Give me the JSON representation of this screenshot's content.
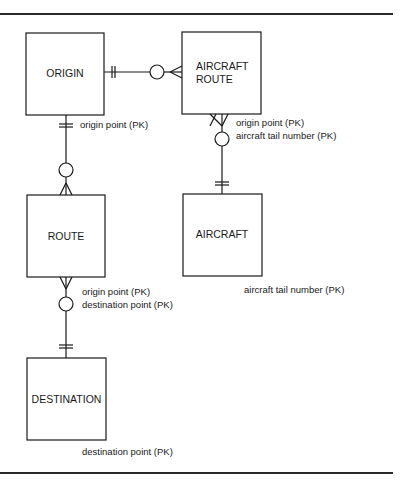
{
  "diagram": {
    "type": "entity-relationship",
    "notation": "crows-foot",
    "colors": {
      "ink": "#1a1a1a",
      "background": "#ffffff"
    },
    "entities": [
      {
        "id": "origin",
        "name": "ORIGIN",
        "attributes": [
          "origin point (PK)"
        ]
      },
      {
        "id": "aircraft_route",
        "name_lines": [
          "AIRCRAFT",
          "ROUTE"
        ],
        "name": "AIRCRAFT ROUTE",
        "attributes": [
          "origin point (PK)",
          "aircraft tail number (PK)"
        ]
      },
      {
        "id": "route",
        "name": "ROUTE",
        "attributes": [
          "origin point (PK)",
          "destination point (PK)"
        ]
      },
      {
        "id": "aircraft",
        "name": "AIRCRAFT",
        "attributes": [
          "aircraft tail number (PK)"
        ]
      },
      {
        "id": "destination",
        "name": "DESTINATION",
        "attributes": [
          "destination point (PK)"
        ]
      }
    ],
    "relationships": [
      {
        "from": "ORIGIN",
        "from_cardinality": "exactly one",
        "to": "AIRCRAFT ROUTE",
        "to_cardinality": "zero or many"
      },
      {
        "from": "ORIGIN",
        "from_cardinality": "exactly one",
        "to": "ROUTE",
        "to_cardinality": "zero or many"
      },
      {
        "from": "AIRCRAFT",
        "from_cardinality": "exactly one",
        "to": "AIRCRAFT ROUTE",
        "to_cardinality": "zero or many"
      },
      {
        "from": "DESTINATION",
        "from_cardinality": "exactly one",
        "to": "ROUTE",
        "to_cardinality": "zero or many"
      }
    ]
  }
}
